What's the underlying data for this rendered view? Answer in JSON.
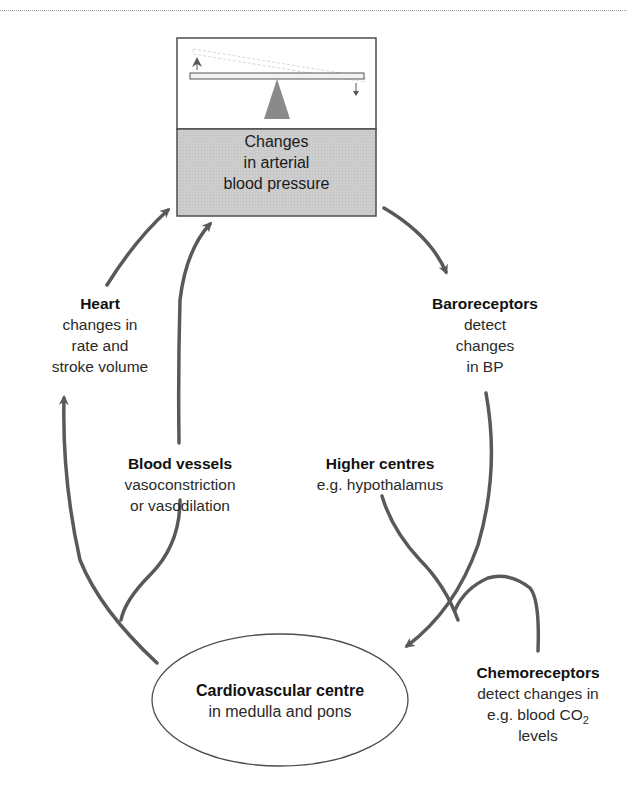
{
  "diagram": {
    "type": "feedback-loop",
    "colors": {
      "arrow": "#595959",
      "box_border": "#4d4d4d",
      "box_lower_fill": "#c9c9c9",
      "box_upper_fill": "#ffffff",
      "fulcrum": "#8a8a8a",
      "ellipse_fill": "#ffffff",
      "ellipse_border": "#4d4d4d"
    },
    "bp_box": {
      "icon": "seesaw-balance-icon",
      "lines": [
        "Changes",
        "in arterial",
        "blood pressure"
      ]
    },
    "baroreceptors": {
      "title": "Baroreceptors",
      "lines": [
        "detect",
        "changes",
        "in BP"
      ]
    },
    "heart": {
      "title": "Heart",
      "lines": [
        "changes in",
        "rate and",
        "stroke volume"
      ]
    },
    "blood_vessels": {
      "title": "Blood vessels",
      "lines": [
        "vasoconstriction",
        "or vasodilation"
      ]
    },
    "higher_centres": {
      "title": "Higher centres",
      "lines": [
        "e.g. hypothalamus"
      ]
    },
    "chemoreceptors": {
      "title": "Chemoreceptors",
      "lines": [
        "detect changes in",
        "e.g. blood CO",
        "levels"
      ],
      "subscript": "2"
    },
    "cardiovascular_centre": {
      "title": "Cardiovascular centre",
      "lines": [
        "in medulla and pons"
      ]
    },
    "edges": [
      {
        "from": "bp_box",
        "to": "baroreceptors"
      },
      {
        "from": "baroreceptors",
        "to": "cardiovascular_centre"
      },
      {
        "from": "higher_centres",
        "to": "cardiovascular_centre"
      },
      {
        "from": "chemoreceptors",
        "to": "cardiovascular_centre"
      },
      {
        "from": "cardiovascular_centre",
        "to": "heart"
      },
      {
        "from": "cardiovascular_centre",
        "to": "blood_vessels"
      },
      {
        "from": "heart",
        "to": "bp_box"
      },
      {
        "from": "blood_vessels",
        "to": "bp_box"
      }
    ]
  }
}
